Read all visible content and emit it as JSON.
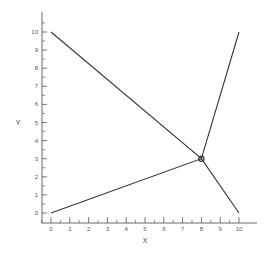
{
  "chart_data": {
    "type": "line",
    "title": "",
    "xlabel": "X",
    "ylabel": "Y",
    "xlim": [
      0,
      10
    ],
    "ylim": [
      0,
      10
    ],
    "xticks": [
      "0",
      "1",
      "2",
      "3",
      "4",
      "5",
      "6",
      "7",
      "8",
      "9",
      "10"
    ],
    "yticks": [
      "0",
      "1",
      "2",
      "3",
      "4",
      "5",
      "6",
      "7",
      "8",
      "9",
      "10"
    ],
    "grid": false,
    "series": [
      {
        "name": "line-1",
        "points": [
          [
            0,
            10
          ],
          [
            8,
            3
          ],
          [
            10,
            0
          ]
        ]
      },
      {
        "name": "line-2",
        "points": [
          [
            0,
            0
          ],
          [
            8,
            3
          ],
          [
            10,
            10
          ]
        ]
      }
    ],
    "annotations": [
      {
        "type": "circle-marker",
        "x": 8,
        "y": 3,
        "label": "intersection"
      }
    ],
    "colors": {
      "line": "#333333",
      "axis": "#444444"
    }
  }
}
